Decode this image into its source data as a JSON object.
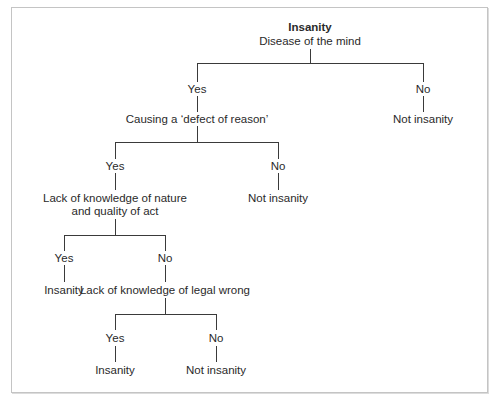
{
  "title": "Insanity",
  "root": {
    "title": "Insanity",
    "question": "Disease of the mind"
  },
  "level1": {
    "yes": "Yes",
    "no": "No",
    "no_outcome": "Not insanity",
    "yes_question": "Causing a ‘defect of reason’"
  },
  "level2": {
    "yes": "Yes",
    "no": "No",
    "no_outcome": "Not insanity",
    "yes_question_line1": "Lack of knowledge of nature",
    "yes_question_line2": "and quality of act"
  },
  "level3": {
    "yes": "Yes",
    "no": "No",
    "yes_outcome": "Insanity",
    "no_question": "Lack of knowledge of legal wrong"
  },
  "level4": {
    "yes": "Yes",
    "no": "No",
    "yes_outcome": "Insanity",
    "no_outcome": "Not insanity"
  },
  "colors": {
    "line": "#3a3a3a",
    "text": "#2a2a2a",
    "border": "#c4c4c4"
  }
}
